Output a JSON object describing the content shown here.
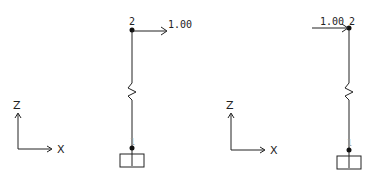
{
  "diagrams": [
    {
      "axes": {
        "vertical_label": "Z",
        "horizontal_label": "X"
      },
      "nodes": {
        "top": "2",
        "bottom": "1"
      },
      "load": {
        "value": "1.00",
        "direction": "+X",
        "applied_at": "2"
      }
    },
    {
      "axes": {
        "vertical_label": "Z",
        "horizontal_label": "X"
      },
      "nodes": {
        "top": "2",
        "bottom": "1"
      },
      "load": {
        "value": "1.00",
        "direction": "+X",
        "applied_at": "2"
      }
    }
  ],
  "colors": {
    "line": "#222222",
    "background": "#ffffff"
  }
}
